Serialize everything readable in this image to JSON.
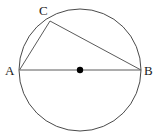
{
  "diagram": {
    "kind": "circle-with-inscribed-right-triangle",
    "canvas": {
      "width": 156,
      "height": 138,
      "background": "#ffffff"
    },
    "colors": {
      "stroke": "#4a4a4a",
      "chord_stroke": "#5a5a5a",
      "center_dot": "#000000",
      "label_text": "#1a1a1a"
    },
    "circle": {
      "name": "main-circle",
      "center_x": 80,
      "center_y": 70,
      "radius": 61,
      "stroke_width": 1
    },
    "center_point": {
      "name": "center-point",
      "x": 80,
      "y": 70,
      "radius": 3.2,
      "filled": true
    },
    "points": [
      {
        "id": "A",
        "label": "A",
        "x": 19.5,
        "y": 70,
        "label_x": 5,
        "label_y": 75
      },
      {
        "id": "B",
        "label": "B",
        "x": 141,
        "y": 70,
        "label_x": 144,
        "label_y": 75
      },
      {
        "id": "C",
        "label": "C",
        "x": 50,
        "y": 21,
        "label_x": 39,
        "label_y": 15
      }
    ],
    "segments": [
      {
        "id": "AB",
        "name": "diameter-ab",
        "from": "A",
        "to": "B",
        "x1": 19.5,
        "y1": 70,
        "x2": 141,
        "y2": 70,
        "stroke_width": 1
      },
      {
        "id": "AC",
        "name": "chord-ac",
        "from": "A",
        "to": "C",
        "x1": 19.5,
        "y1": 70,
        "x2": 50,
        "y2": 21,
        "stroke_width": 1
      },
      {
        "id": "CB",
        "name": "chord-cb",
        "from": "C",
        "to": "B",
        "x1": 50,
        "y1": 21,
        "x2": 141,
        "y2": 70,
        "stroke_width": 1
      }
    ],
    "labels": {
      "a": "A",
      "b": "B",
      "c": "C"
    }
  }
}
